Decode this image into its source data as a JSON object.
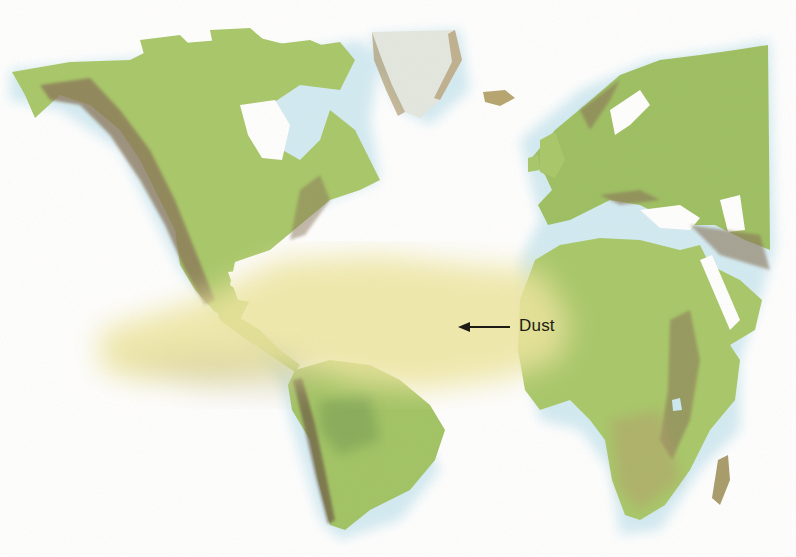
{
  "map": {
    "type": "physical relief world map (Atlantic-centered)",
    "regions_visible": [
      "North America",
      "Greenland",
      "Iceland",
      "Europe",
      "Africa",
      "Middle East",
      "South America",
      "Central America",
      "Caribbean",
      "Madagascar"
    ],
    "colors": {
      "ocean": "#ffffff",
      "coast_glow": "#cfe9f2",
      "lowland": "#a9c86a",
      "forest": "#7fae5a",
      "mountains": "#8a7458",
      "ice": "#e4e8e0",
      "dust_plume": "#efe6a0"
    }
  },
  "annotations": [
    {
      "id": "dust",
      "label": "Dust",
      "arrow_direction": "west"
    }
  ]
}
